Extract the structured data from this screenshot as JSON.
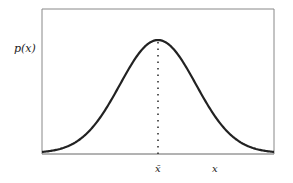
{
  "figure": {
    "y_label": "p(x)",
    "mean_label": "x̄",
    "x_label": "x",
    "curve": "normal distribution bell curve",
    "mean_marker": "dotted vertical line at mean"
  },
  "chart_data": {
    "type": "line",
    "title": "",
    "xlabel": "x",
    "ylabel": "p(x)",
    "annotations": [
      "x̄ (mean) marked with dotted vertical line at peak"
    ],
    "series": [
      {
        "name": "p(x)",
        "description": "Gaussian probability density, symmetric about x̄"
      }
    ],
    "grid": false
  }
}
